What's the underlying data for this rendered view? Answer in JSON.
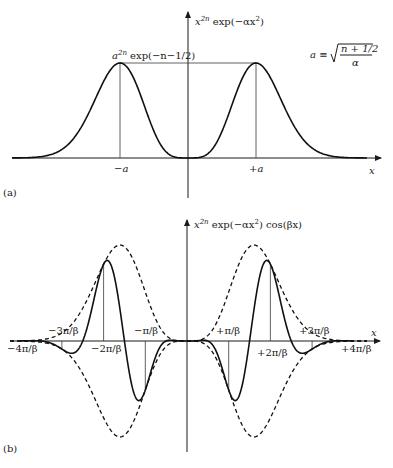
{
  "panel_a": {
    "panel_label": "(a)",
    "y_axis_label": {
      "base": "x",
      "exp": "2n",
      "rest": " exp(−αx",
      "exp2": "2",
      "close": ")"
    },
    "x_axis_label": "x",
    "peak_label": {
      "base": "a",
      "exp": "2n",
      "rest": " exp(−n−1/2)"
    },
    "definition": {
      "lhs": "a ≡ ",
      "numerator": "n + 1/2",
      "denominator": "α"
    },
    "tick_labels": {
      "left": "−a",
      "right": "+a"
    },
    "geometry": {
      "y_axis_x": 188,
      "x_axis_y": 158,
      "peak_x_offset": 68,
      "peak_height": 95,
      "x_start": 12,
      "x_end": 367
    }
  },
  "panel_b": {
    "panel_label": "(b)",
    "y_axis_label": {
      "base": "x",
      "exp": "2n",
      "rest": " exp(−αx",
      "exp2": "2",
      "close": ") cos(βx)"
    },
    "x_axis_label": "x",
    "tick_labels": [
      "−4π/β",
      "−3π/β",
      "−2π/β",
      "−π/β",
      "+π/β",
      "+2π/β",
      "+3π/β",
      "+4π/β"
    ],
    "geometry": {
      "y_axis_x": 187,
      "x_axis_y": 341,
      "pi_over_beta_px": 41.7,
      "env_peak_x_offset": 67,
      "env_peak_height": 96,
      "x_start": 10,
      "x_end": 367
    }
  },
  "chart_data": [
    {
      "type": "line",
      "title": "x^{2n} exp(−αx²)",
      "xlabel": "x",
      "ylabel": "x^{2n} exp(−αx²)",
      "x_ticks": [
        "−a",
        "+a"
      ],
      "annotations": [
        "a^{2n} exp(−n−1/2) (maximum at x = ±a)",
        "a ≡ sqrt((n + 1/2)/α)"
      ],
      "series": [
        {
          "name": "x^{2n} exp(−αx²)",
          "style": "solid",
          "shape": "symmetric double-hump, zero at x=0, maxima at ±a"
        }
      ]
    },
    {
      "type": "line",
      "title": "x^{2n} exp(−αx²) cos(βx)",
      "xlabel": "x",
      "ylabel": "x^{2n} exp(−αx²) cos(βx)",
      "x_ticks": [
        "−4π/β",
        "−3π/β",
        "−2π/β",
        "−π/β",
        "+π/β",
        "+2π/β",
        "+3π/β",
        "+4π/β"
      ],
      "series": [
        {
          "name": "x^{2n} exp(−αx²) cos(βx)",
          "style": "solid"
        },
        {
          "name": "±x^{2n} exp(−αx²) envelope",
          "style": "dashed"
        }
      ]
    }
  ]
}
